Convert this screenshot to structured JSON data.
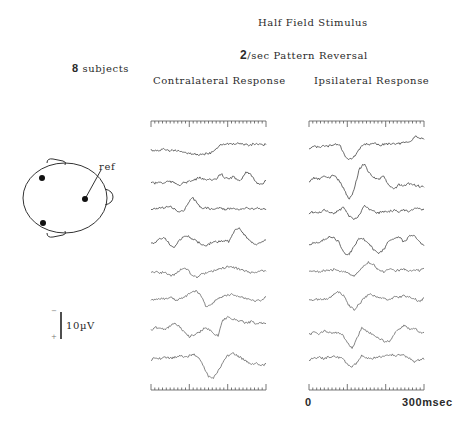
{
  "figure": {
    "title": "Half Field Stimulus",
    "subtitle_num": "2",
    "subtitle_rest": "/sec Pattern Reversal",
    "subjects_num": "8",
    "subjects_label": " subjects",
    "ref_label": "ref",
    "scale_label": "10µV",
    "scale_minus": "−",
    "scale_plus": "+"
  },
  "chart_data": {
    "type": "line",
    "xlabel": "msec",
    "x_ticks": [
      "0",
      "300msec"
    ],
    "xlim": [
      0,
      300
    ],
    "scale_bar": "10µV (negative up)",
    "panels": [
      {
        "name": "Contralateral Response",
        "x0": 151,
        "x1": 266,
        "traces": [
          {
            "baseline": 150,
            "values": [
              0,
              1,
              0,
              -1,
              1,
              0,
              2,
              3,
              4,
              5,
              6,
              7,
              6,
              5,
              3,
              -4,
              -8,
              -9,
              -8,
              -8,
              -9,
              -8,
              -7,
              -8,
              -9,
              -7,
              -8
            ]
          },
          {
            "baseline": 182,
            "values": [
              0,
              2,
              0,
              2,
              -1,
              0,
              2,
              4,
              1,
              0,
              -2,
              -4,
              -6,
              -3,
              -5,
              -2,
              -4,
              -12,
              -6,
              -4,
              -8,
              -2,
              -4,
              -14,
              -12,
              -4,
              2,
              3,
              -2
            ]
          },
          {
            "baseline": 210,
            "values": [
              0,
              -2,
              -4,
              -3,
              -6,
              -2,
              3,
              2,
              -8,
              -18,
              -10,
              -2,
              -3,
              -1,
              -2,
              -3,
              -1,
              -2,
              -3,
              -1,
              -2,
              -3,
              -1,
              -3,
              -2,
              0
            ]
          },
          {
            "baseline": 243,
            "values": [
              0,
              -1,
              -6,
              -8,
              2,
              6,
              -2,
              -8,
              -10,
              -6,
              -2,
              2,
              4,
              0,
              -2,
              -2,
              -4,
              -2,
              -16,
              -22,
              -14,
              -6,
              0,
              2,
              0,
              -4
            ]
          },
          {
            "baseline": 273,
            "values": [
              0,
              -2,
              0,
              -2,
              4,
              2,
              -2,
              -8,
              -4,
              4,
              6,
              2,
              0,
              -2,
              -4,
              -6,
              -8,
              -9,
              -8,
              -6,
              -4,
              -2,
              0,
              -2,
              -4,
              -2
            ]
          },
          {
            "baseline": 300,
            "values": [
              0,
              0,
              -2,
              -2,
              -4,
              0,
              -2,
              -6,
              -10,
              -14,
              -6,
              10,
              6,
              0,
              -4,
              -6,
              -8,
              -6,
              -4,
              -2,
              0,
              2,
              0,
              -4
            ]
          },
          {
            "baseline": 330,
            "values": [
              0,
              -4,
              -2,
              0,
              -6,
              -10,
              -4,
              4,
              10,
              6,
              4,
              -2,
              -2,
              6,
              8,
              -14,
              -18,
              -16,
              -14,
              -12,
              -10,
              -12,
              -8,
              -10,
              -8
            ]
          },
          {
            "baseline": 360,
            "values": [
              0,
              -4,
              -2,
              -4,
              -2,
              -4,
              -6,
              -4,
              -6,
              -8,
              -4,
              10,
              24,
              26,
              16,
              4,
              -6,
              -10,
              -6,
              -2,
              2,
              6,
              4,
              8,
              6
            ]
          }
        ]
      },
      {
        "name": "Ipsilateral Response",
        "x0": 309,
        "x1": 424,
        "traces": [
          {
            "baseline": 148,
            "values": [
              0,
              -2,
              -1,
              -3,
              -2,
              -4,
              -6,
              -4,
              10,
              16,
              14,
              6,
              -4,
              -6,
              -5,
              -6,
              -4,
              -5,
              -6,
              -7,
              -6,
              -7,
              -8,
              -9,
              -18,
              -14,
              -12
            ]
          },
          {
            "baseline": 182,
            "values": [
              0,
              -6,
              -4,
              -8,
              -6,
              -10,
              -2,
              10,
              26,
              12,
              -18,
              -26,
              -14,
              -6,
              -4,
              -8,
              6,
              10,
              4,
              6,
              2,
              4,
              6,
              8
            ]
          },
          {
            "baseline": 213,
            "values": [
              0,
              -2,
              0,
              -4,
              -2,
              0,
              -4,
              -8,
              4,
              10,
              4,
              -10,
              -6,
              -2,
              0,
              -2,
              -2,
              -4,
              -2,
              -4,
              -2,
              -6,
              -6,
              -4
            ]
          },
          {
            "baseline": 245,
            "values": [
              0,
              -4,
              -2,
              -8,
              -12,
              -10,
              -4,
              12,
              14,
              2,
              -10,
              -8,
              -2,
              8,
              12,
              6,
              -6,
              -10,
              -12,
              -4,
              -12,
              -14,
              -6,
              2
            ]
          },
          {
            "baseline": 272,
            "values": [
              0,
              -2,
              0,
              -2,
              -2,
              -4,
              -2,
              0,
              2,
              6,
              0,
              -10,
              -14,
              -10,
              -2,
              0,
              -4,
              -2,
              -2,
              -4,
              -2,
              -3,
              -2,
              -4
            ]
          },
          {
            "baseline": 300,
            "values": [
              0,
              0,
              -1,
              -2,
              -2,
              -8,
              -12,
              -6,
              8,
              14,
              6,
              -2,
              -8,
              -6,
              -4,
              -2,
              0,
              -4,
              -4,
              -6,
              -4,
              -2,
              2,
              -2
            ]
          },
          {
            "baseline": 335,
            "values": [
              0,
              -4,
              -2,
              -6,
              -4,
              -2,
              -4,
              0,
              10,
              20,
              4,
              -10,
              -6,
              -2,
              4,
              6,
              10,
              8,
              -4,
              -10,
              -14,
              -8,
              -10,
              -4,
              -2
            ]
          },
          {
            "baseline": 360,
            "values": [
              0,
              -2,
              -4,
              -2,
              -4,
              -6,
              -4,
              -2,
              6,
              10,
              4,
              -6,
              -2,
              -2,
              -4,
              -4,
              -6,
              -8,
              -6,
              -8,
              -6,
              -2,
              2,
              0,
              -2
            ]
          }
        ]
      }
    ]
  }
}
